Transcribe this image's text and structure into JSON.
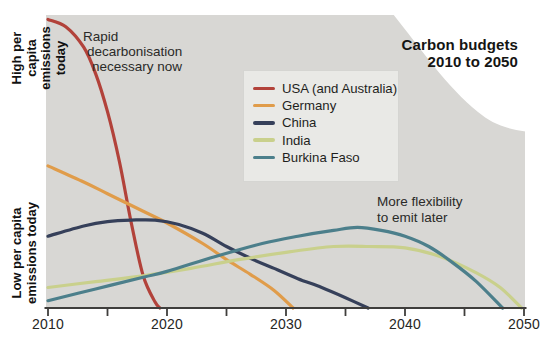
{
  "title": {
    "line1": "Carbon budgets",
    "line2": "2010 to 2050"
  },
  "axis": {
    "y_label_high_line1": "High per capita",
    "y_label_high_line2": "emissions today",
    "y_label_low_line1": "Low per capita",
    "y_label_low_line2": "emissions today",
    "x_labels": [
      "2010",
      "2020",
      "2030",
      "2040",
      "2050"
    ]
  },
  "annotations": {
    "rapid": {
      "lines": [
        "Rapid",
        "decarbonisation",
        "necessary now"
      ]
    },
    "flexibility": {
      "lines": [
        "More flexibility",
        "to emit later"
      ]
    }
  },
  "colors": {
    "plot_background": "#d8d7d4",
    "legend_background": "#e9e9e6",
    "axis": "#3f3e3c",
    "text": "#1d1d1b"
  },
  "chart_data": {
    "type": "line",
    "title": "Carbon budgets 2010 to 2050",
    "xlabel": "year",
    "ylabel": "per capita emissions (relative, qualitative scale)",
    "x_range": [
      2010,
      2050
    ],
    "y_range": [
      0,
      100
    ],
    "grid": false,
    "legend_position": "upper-middle box",
    "x_axis": {
      "tick_years": [
        2010,
        2015,
        2020,
        2025,
        2030,
        2035,
        2040,
        2045,
        2050
      ],
      "labeled_ticks": [
        2010,
        2020,
        2030,
        2040,
        2050
      ]
    },
    "y_axis": {
      "high_label": "High per capita emissions today",
      "low_label": "Low per capita emissions today"
    },
    "series": [
      {
        "name": "USA (and Australia)",
        "color": "#b2423a",
        "points": [
          [
            2010,
            98.5
          ],
          [
            2011.5,
            96
          ],
          [
            2013,
            89
          ],
          [
            2014,
            80
          ],
          [
            2015,
            67
          ],
          [
            2016,
            50
          ],
          [
            2017,
            29
          ],
          [
            2018,
            11
          ],
          [
            2019,
            2
          ],
          [
            2019.4,
            0
          ]
        ]
      },
      {
        "name": "Germany",
        "color": "#e09c4a",
        "points": [
          [
            2010,
            48.5
          ],
          [
            2013,
            43
          ],
          [
            2015,
            39
          ],
          [
            2018,
            33
          ],
          [
            2020,
            29
          ],
          [
            2023,
            22
          ],
          [
            2025,
            16.5
          ],
          [
            2027,
            11.5
          ],
          [
            2029,
            6
          ],
          [
            2030.6,
            0
          ]
        ]
      },
      {
        "name": "China",
        "color": "#36405a",
        "points": [
          [
            2010,
            24.5
          ],
          [
            2013,
            28
          ],
          [
            2015,
            29.5
          ],
          [
            2017,
            30
          ],
          [
            2019,
            30
          ],
          [
            2021,
            28.5
          ],
          [
            2023,
            25.5
          ],
          [
            2025,
            21
          ],
          [
            2027,
            17
          ],
          [
            2029,
            13.5
          ],
          [
            2031,
            10
          ],
          [
            2033,
            7
          ],
          [
            2035,
            3.5
          ],
          [
            2036.9,
            0
          ]
        ]
      },
      {
        "name": "India",
        "color": "#c9d08c",
        "points": [
          [
            2010,
            7
          ],
          [
            2014,
            9
          ],
          [
            2018,
            11
          ],
          [
            2022,
            13.5
          ],
          [
            2026,
            16.5
          ],
          [
            2030,
            19
          ],
          [
            2034,
            21
          ],
          [
            2037,
            21
          ],
          [
            2040,
            20.5
          ],
          [
            2043,
            17.5
          ],
          [
            2046,
            12
          ],
          [
            2048,
            7
          ],
          [
            2049.8,
            0
          ]
        ]
      },
      {
        "name": "Burkina Faso",
        "color": "#4c7f8b",
        "points": [
          [
            2010,
            2.5
          ],
          [
            2014,
            6.5
          ],
          [
            2018,
            10.5
          ],
          [
            2020,
            12.5
          ],
          [
            2024,
            17.5
          ],
          [
            2028,
            22
          ],
          [
            2031,
            24.5
          ],
          [
            2034,
            26.5
          ],
          [
            2036,
            27.5
          ],
          [
            2038,
            26.5
          ],
          [
            2040,
            24.5
          ],
          [
            2042,
            21
          ],
          [
            2044,
            15.5
          ],
          [
            2046,
            9
          ],
          [
            2048.2,
            0
          ]
        ]
      }
    ]
  }
}
